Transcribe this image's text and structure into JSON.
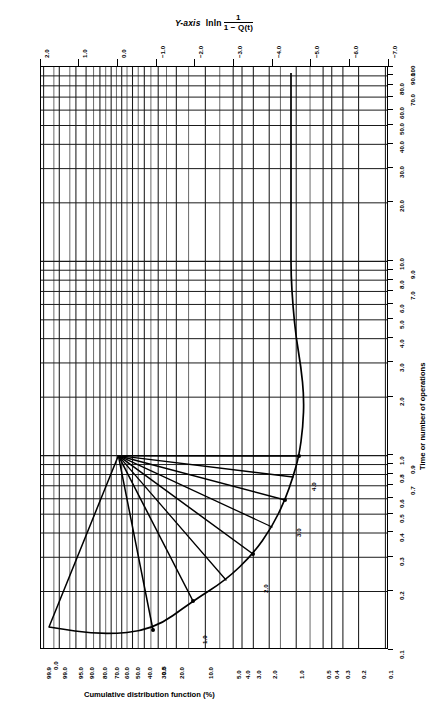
{
  "header": {
    "y_axis_label": "Y-axis",
    "function_name": "lnln",
    "numerator": "1",
    "denominator": "1 − Q(t)"
  },
  "axes": {
    "top": {
      "name": "lnln-scale",
      "ticks": [
        "2.0",
        "1.0",
        "0.0",
        "−1.0",
        "−2.0",
        "−3.0",
        "−4.0",
        "−5.0",
        "−6.0",
        "−7.0"
      ],
      "values": [
        2.0,
        1.0,
        0.0,
        -1.0,
        -2.0,
        -3.0,
        -4.0,
        -5.0,
        -6.0,
        -7.0
      ]
    },
    "bottom": {
      "name": "cumulative-distribution-function",
      "title": "Cumulative distribution function (%)",
      "ticks": [
        "99.9",
        "99.0",
        "95.0",
        "90.0",
        "80.0",
        "70.0",
        "60.0",
        "50.0",
        "40.0",
        "30.0",
        "20.0",
        "10.0",
        "5.0",
        "4.0",
        "3.0",
        "2.0",
        "1.0",
        "0.5",
        "0.4",
        "0.3",
        "0.2",
        "0.1"
      ],
      "values": [
        99.9,
        99.0,
        95.0,
        90.0,
        80.0,
        70.0,
        60.0,
        50.0,
        40.0,
        30.0,
        20.0,
        10.0,
        5.0,
        4.0,
        3.0,
        2.0,
        1.0,
        0.5,
        0.4,
        0.3,
        0.2,
        0.1
      ]
    },
    "right": {
      "name": "time-or-operations",
      "title": "Time or number of operations",
      "ticks": [
        "100",
        "90.0",
        "80.0",
        "70.0",
        "60.0",
        "50.0",
        "40.0",
        "30.0",
        "20.0",
        "10.0",
        "9.0",
        "8.0",
        "7.0",
        "6.0",
        "5.0",
        "4.0",
        "3.0",
        "2.0",
        "1.0",
        "0.9",
        "0.8",
        "0.7",
        "0.6",
        "0.5",
        "0.4",
        "0.3",
        "0.2",
        "0.1"
      ],
      "values": [
        100,
        90,
        80,
        70,
        60,
        50,
        40,
        30,
        20,
        10,
        9,
        8,
        7,
        6,
        5,
        4,
        3,
        2,
        1,
        0.9,
        0.8,
        0.7,
        0.6,
        0.5,
        0.4,
        0.3,
        0.2,
        0.1
      ]
    }
  },
  "beta_fan": {
    "name": "beta-estimator-fan",
    "labels": [
      "0.0",
      "0.5",
      "1.0",
      "2.0",
      "3.0",
      "4.0"
    ],
    "values": [
      0.0,
      0.5,
      1.0,
      2.0,
      3.0,
      4.0
    ]
  },
  "chart_data": {
    "type": "line",
    "xlabel": "Cumulative distribution function (%)",
    "ylabel": "Time or number of operations",
    "top_axis_label": "Y-axis lnln 1/(1 − Q(t))",
    "grid": true,
    "legend": "none",
    "x_scale": "weibull-probability",
    "y_scale": "log",
    "ylim": [
      0.1,
      100
    ],
    "xlim": [
      99.9,
      0.1
    ],
    "top_axis_range": [
      2.0,
      -7.0
    ],
    "top_axis_ticks": [
      2.0,
      1.0,
      0.0,
      -1.0,
      -2.0,
      -3.0,
      -4.0,
      -5.0,
      -6.0,
      -7.0
    ],
    "x_ticks": [
      99.9,
      99.0,
      95.0,
      90.0,
      80.0,
      70.0,
      60.0,
      50.0,
      40.0,
      30.0,
      20.0,
      10.0,
      5.0,
      4.0,
      3.0,
      2.0,
      1.0,
      0.5,
      0.4,
      0.3,
      0.2,
      0.1
    ],
    "y_ticks": [
      0.1,
      0.2,
      0.3,
      0.4,
      0.5,
      0.6,
      0.7,
      0.8,
      0.9,
      1,
      2,
      3,
      4,
      5,
      6,
      7,
      8,
      9,
      10,
      20,
      30,
      40,
      50,
      60,
      70,
      80,
      90,
      100
    ],
    "series": [
      {
        "name": "beta = 0.0",
        "annotation": "0.0"
      },
      {
        "name": "beta = 0.5",
        "annotation": "0.5"
      },
      {
        "name": "beta = 1.0",
        "annotation": "1.0"
      },
      {
        "name": "beta = 2.0",
        "annotation": "2.0"
      },
      {
        "name": "beta = 3.0",
        "annotation": "3.0"
      },
      {
        "name": "beta = 4.0",
        "annotation": "4.0"
      }
    ],
    "annotations": [
      "0.0",
      "0.5",
      "1.0",
      "2.0",
      "3.0",
      "4.0"
    ]
  }
}
